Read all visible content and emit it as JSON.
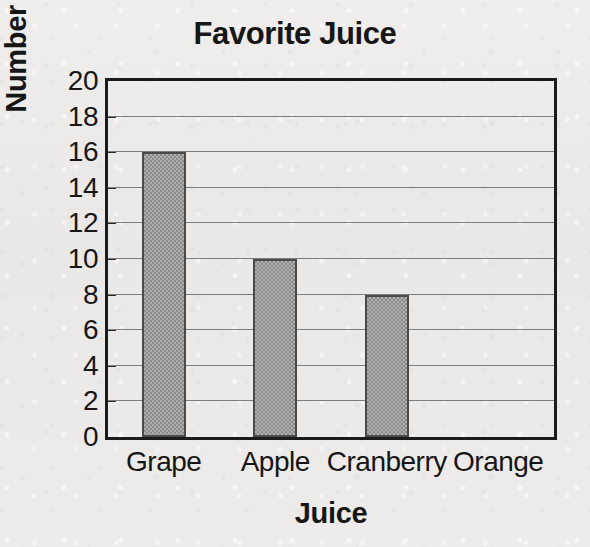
{
  "chart_data": {
    "type": "bar",
    "title": "Favorite Juice",
    "xlabel": "Juice",
    "ylabel": "Number of Votes",
    "categories": [
      "Grape",
      "Apple",
      "Cranberry",
      "Orange"
    ],
    "values": [
      16,
      10,
      8,
      0
    ],
    "ylim": [
      0,
      20
    ],
    "ytick_step": 2,
    "yticks": [
      0,
      2,
      4,
      6,
      8,
      10,
      12,
      14,
      16,
      18,
      20
    ],
    "ytick_labels": [
      "0",
      "2",
      "4",
      "6",
      "8",
      "10",
      "12",
      "14",
      "16",
      "18",
      "20"
    ],
    "grid": true,
    "grid_axis": "y",
    "legend": false,
    "legend_position": "none",
    "bar_color": "#9b9b9b",
    "bar_edge_color": "#4a4a4a",
    "frame_color": "#1b1b1b",
    "gridline_color": "#7d7d7d",
    "background_color": "#ecebe9",
    "text_color": "#161616",
    "annotations": []
  }
}
